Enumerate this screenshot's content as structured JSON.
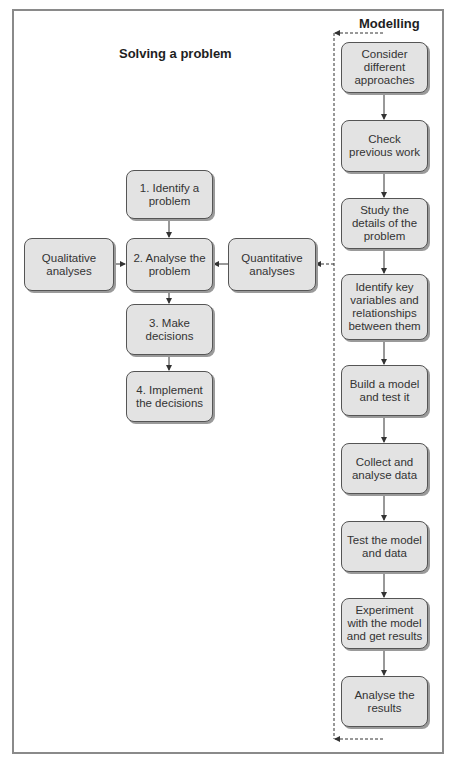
{
  "diagram": {
    "left_title": "Solving a problem",
    "right_title": "Modelling",
    "problem_steps": [
      {
        "id": "identify",
        "label": "1. Identify a problem"
      },
      {
        "id": "analyse",
        "label": "2. Analyse the problem"
      },
      {
        "id": "decide",
        "label": "3. Make decisions"
      },
      {
        "id": "implement",
        "label": "4. Implement the decisions"
      }
    ],
    "side_boxes": {
      "qualitative": "Qualitative analyses",
      "quantitative": "Quantitative analyses"
    },
    "modelling_steps": [
      {
        "id": "m1",
        "label": "Consider different approaches"
      },
      {
        "id": "m2",
        "label": "Check previous work"
      },
      {
        "id": "m3",
        "label": "Study the details of the problem"
      },
      {
        "id": "m4",
        "label": "Identify key variables and relationships between them"
      },
      {
        "id": "m5",
        "label": "Build a model and test it"
      },
      {
        "id": "m6",
        "label": "Collect and analyse data"
      },
      {
        "id": "m7",
        "label": "Test the model and data"
      },
      {
        "id": "m8",
        "label": "Experiment with the model and get results"
      },
      {
        "id": "m9",
        "label": "Analyse the results"
      }
    ],
    "colors": {
      "box_fill": "#e3e3e3",
      "box_border": "#555555",
      "frame_border": "#8a8a8a",
      "arrow": "#333333"
    }
  }
}
